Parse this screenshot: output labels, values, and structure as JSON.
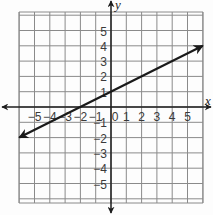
{
  "chart_data": {
    "type": "line",
    "title": "",
    "xlabel": "x",
    "ylabel": "y",
    "xlim": [
      -6,
      6
    ],
    "ylim": [
      -6,
      6
    ],
    "grid": true,
    "x_ticks": [
      -5,
      -4,
      -3,
      -2,
      -1,
      0,
      1,
      2,
      3,
      4,
      5
    ],
    "x_tick_labels": [
      "−5",
      "−4",
      "−3",
      "−2",
      "−1",
      "0",
      "1",
      "2",
      "3",
      "4",
      "5"
    ],
    "y_ticks": [
      5,
      4,
      3,
      2,
      1,
      -1,
      -2,
      -3,
      -4,
      -5
    ],
    "y_tick_labels": [
      "5",
      "4",
      "3",
      "2",
      "1",
      "−1",
      "−2",
      "−3",
      "−4",
      "−5"
    ],
    "series": [
      {
        "name": "y = 0.5x + 1",
        "equation": "y = 0.5x + 1",
        "slope": 0.5,
        "intercept": 1,
        "x": [
          -6,
          6
        ],
        "y": [
          -2,
          4
        ],
        "arrows": "both",
        "color": "#1a1a1a"
      }
    ]
  }
}
